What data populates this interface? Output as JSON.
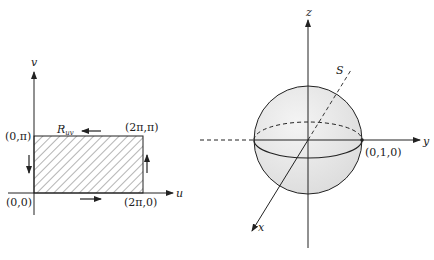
{
  "left_figure": {
    "title": "Parameter domain rectangle",
    "axis_labels": {
      "vertical": "v",
      "horizontal": "u"
    },
    "region_label": "R",
    "region_label_sub": "uv",
    "corners": {
      "bottom_left": "(0,0)",
      "top_left": "(0,π)",
      "top_right": "(2π,π)",
      "bottom_right": "(2π,0)"
    },
    "orientation": "counterclockwise boundary arrows",
    "colors": {
      "line": "#222222",
      "hatch": "#444444"
    }
  },
  "right_figure": {
    "title": "Unit sphere",
    "axis_labels": {
      "x": "x",
      "y": "y",
      "z": "z"
    },
    "surface_label": "S",
    "point_label": "(0,1,0)",
    "colors": {
      "line": "#222222",
      "sphere_fill": "#e6e6e6"
    }
  }
}
